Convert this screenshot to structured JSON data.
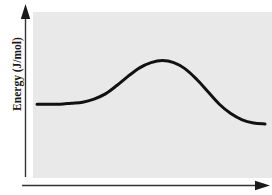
{
  "figure": {
    "name": "reaction-energy-diagram",
    "background_color": "#ffffff",
    "panel_color": "#e9e9e9"
  },
  "axes": {
    "y_label": "Energy (J/mol)",
    "x_label": "",
    "y_arrow": "up-arrow-icon",
    "x_arrow": "right-arrow-icon",
    "axis_color": "#333333"
  },
  "chart_data": {
    "type": "line",
    "title": "",
    "xlabel": "",
    "ylabel": "Energy (J/mol)",
    "grid": false,
    "legend": null,
    "xlim": [
      0,
      100
    ],
    "ylim": [
      0,
      100
    ],
    "x_tick_labels": [],
    "y_tick_labels": [],
    "series": [
      {
        "name": "Reaction energy profile",
        "color": "#111111",
        "linewidth": 3,
        "x": [
          0,
          5,
          10,
          15,
          20,
          25,
          30,
          35,
          40,
          45,
          50,
          55,
          60,
          65,
          70,
          75,
          80,
          85,
          90,
          95,
          100
        ],
        "y": [
          44,
          44,
          44,
          45,
          46,
          49,
          54,
          62,
          71,
          79,
          84,
          86,
          84,
          78,
          68,
          56,
          44,
          35,
          29,
          26,
          25
        ]
      }
    ],
    "annotations": {
      "reactant_plateau_energy": 44,
      "transition_state_energy": 86,
      "product_plateau_energy": 25,
      "activation_energy": 42,
      "delta_energy": -19,
      "reaction_type": "exothermic"
    }
  }
}
